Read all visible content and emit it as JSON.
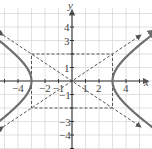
{
  "chart_data": {
    "type": "line",
    "title": "",
    "xlabel": "x",
    "ylabel": "y",
    "xlim": [
      -5.3,
      5.5
    ],
    "ylim": [
      -5,
      5.5
    ],
    "grid": true,
    "x_tick_labels": [
      "-4",
      "-2",
      "-1",
      "1",
      "2",
      "4"
    ],
    "y_tick_labels": [
      "4",
      "3",
      "1",
      "-1",
      "-3",
      "-4"
    ],
    "series": [
      {
        "name": "hyperbola",
        "equation": "x^2/9 - y^2/4 = 1",
        "style": "solid",
        "color": "#6e6e6e",
        "vertices": [
          [
            -3,
            0
          ],
          [
            3,
            0
          ]
        ]
      },
      {
        "name": "asymptote-1",
        "equation": "y = (2/3)x",
        "style": "dashed",
        "color": "#555555"
      },
      {
        "name": "asymptote-2",
        "equation": "y = -(2/3)x",
        "style": "dashed",
        "color": "#555555"
      },
      {
        "name": "fundamental-rectangle",
        "corners": [
          [
            -3,
            -2
          ],
          [
            3,
            -2
          ],
          [
            3,
            2
          ],
          [
            -3,
            2
          ]
        ],
        "style": "dashed",
        "color": "#555555"
      }
    ]
  },
  "axes": {
    "x_label": "x",
    "y_label": "y"
  },
  "colors": {
    "grid": "#d9d9d9",
    "axis": "#333333",
    "curve": "#6e6e6e",
    "dashed": "#555555"
  }
}
